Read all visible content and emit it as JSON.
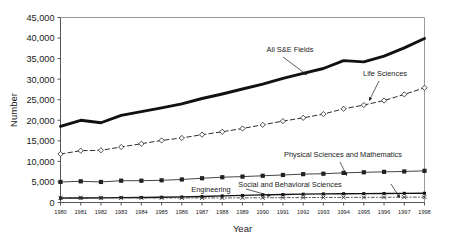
{
  "chart_data": {
    "type": "line",
    "title": "",
    "xlabel": "Year",
    "ylabel": "Number",
    "grid": false,
    "legend_position": "inline-annotations",
    "x": [
      1980,
      1981,
      1982,
      1983,
      1984,
      1985,
      1986,
      1987,
      1988,
      1989,
      1990,
      1991,
      1992,
      1993,
      1994,
      1995,
      1996,
      1997,
      1998
    ],
    "xtick_labels": [
      "1980",
      "1981",
      "1982",
      "1983",
      "1984",
      "1985",
      "1986",
      "1987",
      "1988",
      "1989",
      "1990",
      "1991",
      "1992",
      "1993",
      "1994",
      "1995",
      "1996",
      "1997",
      "1998"
    ],
    "ylim": [
      0,
      45000
    ],
    "ytick_labels": [
      "0",
      "5,000",
      "10,000",
      "15,000",
      "20,000",
      "25,000",
      "30,000",
      "35,000",
      "40,000",
      "45,000"
    ],
    "ytick_values": [
      0,
      5000,
      10000,
      15000,
      20000,
      25000,
      30000,
      35000,
      40000,
      45000
    ],
    "series": [
      {
        "name": "All S&E Fields",
        "style": "thick-solid",
        "color": "#111111",
        "marker": "none",
        "values": [
          18500,
          20000,
          19400,
          21200,
          22100,
          23000,
          24000,
          25300,
          26400,
          27600,
          28800,
          30200,
          31400,
          32600,
          34500,
          34200,
          35600,
          37600,
          39900
        ]
      },
      {
        "name": "Life Sciences",
        "style": "dashed",
        "color": "#222222",
        "marker": "open-diamond",
        "values": [
          11800,
          12600,
          12700,
          13500,
          14300,
          15100,
          15700,
          16500,
          17200,
          18000,
          18900,
          19800,
          20600,
          21500,
          22800,
          23700,
          24800,
          26300,
          27900
        ]
      },
      {
        "name": "Physical Sciences and Mathematics",
        "style": "thin-solid",
        "color": "#222222",
        "marker": "filled-square",
        "values": [
          5000,
          5150,
          5000,
          5300,
          5300,
          5400,
          5600,
          5900,
          6150,
          6300,
          6500,
          6700,
          6900,
          7000,
          7200,
          7350,
          7450,
          7550,
          7700
        ]
      },
      {
        "name": "Engineering",
        "style": "solid",
        "color": "#111111",
        "marker": "filled-square-small",
        "values": [
          1050,
          1100,
          1120,
          1180,
          1220,
          1280,
          1350,
          1450,
          1600,
          1720,
          1840,
          1950,
          2030,
          2090,
          2140,
          2170,
          2200,
          2230,
          2250
        ]
      },
      {
        "name": "Social and Behavioral Sciences",
        "style": "dash-dot",
        "color": "#333333",
        "marker": "cross",
        "values": [
          1150,
          1160,
          1140,
          1130,
          1120,
          1110,
          1100,
          1100,
          1110,
          1130,
          1150,
          1180,
          1200,
          1220,
          1240,
          1250,
          1270,
          1290,
          1310
        ]
      }
    ],
    "annotations": [
      {
        "text": "All S&E Fields",
        "label_x": 290,
        "label_y": 52,
        "arrow_from_x": 283,
        "arrow_from_y": 57,
        "arrow_to_x": 307,
        "arrow_to_y": 75
      },
      {
        "text": "Life Sciences",
        "label_x": 385,
        "label_y": 76,
        "arrow_from_x": 379,
        "arrow_from_y": 81,
        "arrow_to_x": 369,
        "arrow_to_y": 101
      },
      {
        "text": "Physical Sciences and Mathematics",
        "label_x": 343,
        "label_y": 157,
        "arrow_from_x": 340,
        "arrow_from_y": 162,
        "arrow_to_x": 347,
        "arrow_to_y": 176
      },
      {
        "text": "Engineering",
        "label_x": 211,
        "label_y": 192,
        "arrow_from_x": 246,
        "arrow_from_y": 189,
        "arrow_to_x": 271,
        "arrow_to_y": 196
      },
      {
        "text": "Social and Behavioral Sciences",
        "label_x": 290,
        "label_y": 187,
        "arrow_from_x": 391,
        "arrow_from_y": 184,
        "arrow_to_x": 400,
        "arrow_to_y": 198
      }
    ]
  }
}
